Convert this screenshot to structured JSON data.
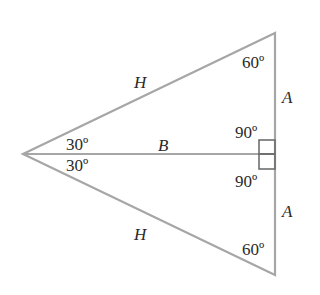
{
  "diagram": {
    "type": "geometry",
    "line_color": "#a6a6a6",
    "text_color": "#2a2a2a",
    "labels": {
      "hyp_top": "H",
      "hyp_bottom": "H",
      "base": "B",
      "side_top": "A",
      "side_bottom": "A",
      "angle_top_vertex": "60º",
      "angle_bottom_vertex": "60º",
      "angle_left_upper": "30º",
      "angle_left_lower": "30º",
      "angle_right_upper": "90º",
      "angle_right_lower": "90º"
    }
  }
}
